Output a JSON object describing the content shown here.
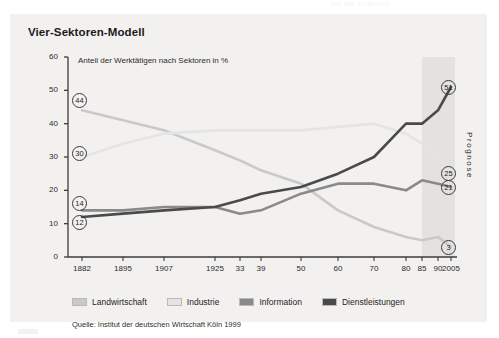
{
  "page": {
    "faint_header_text": "auf die Sektoren"
  },
  "panel": {
    "title": "Vier-Sektoren-Modell",
    "axis_note": "Anteil der Werktätigen nach Sektoren in %",
    "forecast_label": "Prognose",
    "source": "Quelle: Institut der deutschen Wirtschaft Köln 1999"
  },
  "legend": {
    "items": [
      {
        "label": "Landwirtschaft",
        "color": "#c9c9c9"
      },
      {
        "label": "Industrie",
        "color": "#e4e4e4"
      },
      {
        "label": "Information",
        "color": "#8a8a8a"
      },
      {
        "label": "Dienstleistungen",
        "color": "#4a4a4a"
      }
    ]
  },
  "chart_data": {
    "type": "line",
    "title": "Vier-Sektoren-Modell",
    "subtitle": "Anteil der Werktätigen nach Sektoren in %",
    "xlabel": "",
    "ylabel": "Anteil der Werktätigen nach Sektoren in %",
    "ylim": [
      0,
      60
    ],
    "yticks": [
      0,
      10,
      20,
      30,
      40,
      50,
      60
    ],
    "grid": false,
    "legend_position": "bottom",
    "categories": [
      "1882",
      "1895",
      "1907",
      "1925",
      "33",
      "39",
      "50",
      "60",
      "70",
      "80",
      "85",
      "90",
      "2005"
    ],
    "forecast_from": "1990",
    "series": [
      {
        "name": "Landwirtschaft",
        "color": "#c9c9c9",
        "values": [
          44,
          41,
          38,
          32,
          29,
          26,
          22,
          14,
          9,
          6,
          5,
          6,
          3
        ],
        "start_label": "44",
        "end_label": "3"
      },
      {
        "name": "Industrie",
        "color": "#e4e4e4",
        "values": [
          30,
          34,
          37,
          38,
          38,
          38,
          38,
          39,
          40,
          37,
          34,
          31,
          25
        ],
        "start_label": "30",
        "end_label": "25"
      },
      {
        "name": "Information",
        "color": "#8a8a8a",
        "values": [
          14,
          14,
          15,
          15,
          13,
          14,
          19,
          22,
          22,
          20,
          23,
          22,
          21
        ],
        "start_label": "14",
        "end_label": "21"
      },
      {
        "name": "Dienstleistungen",
        "color": "#4a4a4a",
        "values": [
          12,
          13,
          14,
          15,
          17,
          19,
          21,
          25,
          30,
          40,
          40,
          44,
          51
        ],
        "start_label": "12",
        "end_label": "51"
      }
    ],
    "start_labels": [
      "44",
      "30",
      "14",
      "12"
    ],
    "end_labels": [
      "51",
      "25",
      "21",
      "3"
    ]
  }
}
